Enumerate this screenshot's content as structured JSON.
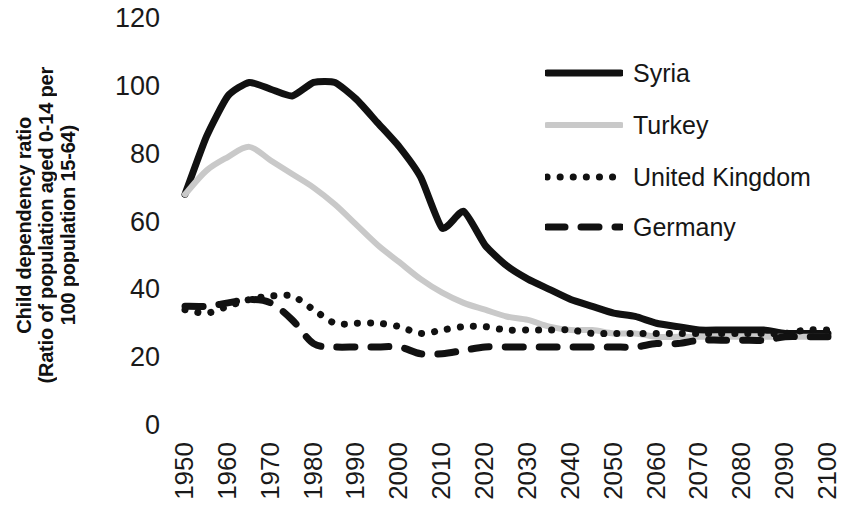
{
  "chart_data": {
    "type": "line",
    "title": "",
    "xlabel": "",
    "ylabel": "Child dependency ratio (Ratio of population aged 0-14 per 100 population 15-64)",
    "ylabel_lines": [
      "Child dependency ratio",
      "(Ratio of population aged 0-14 per",
      "100 population 15-64)"
    ],
    "xlim": [
      1950,
      2100
    ],
    "ylim": [
      0,
      120
    ],
    "y_ticks": [
      120,
      100,
      80,
      60,
      40,
      20,
      0
    ],
    "x_ticks": [
      "1950",
      "1960",
      "1970",
      "1980",
      "1990",
      "2000",
      "2010",
      "2020",
      "2030",
      "2040",
      "2050",
      "2060",
      "2070",
      "2080",
      "2090",
      "2100"
    ],
    "grid": false,
    "legend_position": "top-right",
    "x": [
      1950,
      1955,
      1960,
      1965,
      1970,
      1975,
      1980,
      1985,
      1990,
      1995,
      2000,
      2005,
      2010,
      2015,
      2020,
      2025,
      2030,
      2035,
      2040,
      2045,
      2050,
      2055,
      2060,
      2065,
      2070,
      2075,
      2080,
      2085,
      2090,
      2095,
      2100
    ],
    "series": [
      {
        "name": "Syria",
        "color": "#111111",
        "line_style": "solid",
        "values": [
          68,
          85,
          97,
          101,
          99,
          97,
          101,
          101,
          96,
          89,
          82,
          73,
          58,
          63,
          53,
          47,
          43,
          40,
          37,
          35,
          33,
          32,
          30,
          29,
          28,
          28,
          28,
          28,
          27,
          27,
          27
        ]
      },
      {
        "name": "Turkey",
        "color": "#c9c9c9",
        "line_style": "solid",
        "values": [
          68,
          75,
          79,
          82,
          78,
          74,
          70,
          65,
          59,
          53,
          48,
          43,
          39,
          36,
          34,
          32,
          31,
          29,
          28,
          28,
          27,
          27,
          26,
          26,
          26,
          26,
          26,
          26,
          26,
          26,
          26
        ]
      },
      {
        "name": "United Kingdom",
        "color": "#111111",
        "line_style": "dotted",
        "values": [
          34,
          33,
          35,
          37,
          38,
          38,
          34,
          30,
          30,
          30,
          29,
          27,
          28,
          29,
          29,
          28,
          28,
          28,
          28,
          27,
          27,
          27,
          27,
          27,
          27,
          27,
          27,
          27,
          27,
          28,
          28
        ]
      },
      {
        "name": "Germany",
        "color": "#111111",
        "line_style": "dashed",
        "values": [
          35,
          35,
          36,
          37,
          36,
          31,
          24,
          23,
          23,
          23,
          23,
          21,
          21,
          22,
          23,
          23,
          23,
          23,
          23,
          23,
          23,
          23,
          24,
          24,
          25,
          25,
          25,
          25,
          26,
          26,
          26
        ]
      }
    ]
  },
  "legend": {
    "items": [
      {
        "label": "Syria"
      },
      {
        "label": "Turkey"
      },
      {
        "label": "United Kingdom"
      },
      {
        "label": "Germany"
      }
    ]
  }
}
